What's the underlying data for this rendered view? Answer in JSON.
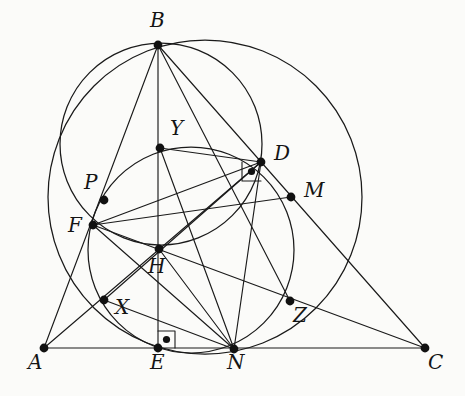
{
  "figure": {
    "kind": "euclidean-geometry-diagram",
    "width": 465,
    "height": 396,
    "background_color": "#fbfbf9",
    "ink_color": "#1a1a1a"
  },
  "points": [
    {
      "id": "A",
      "label": "A",
      "x": 44,
      "y": 348,
      "label_x": 28,
      "label_y": 352
    },
    {
      "id": "B",
      "label": "B",
      "x": 158,
      "y": 45,
      "label_x": 150,
      "label_y": 10
    },
    {
      "id": "C",
      "label": "C",
      "x": 425,
      "y": 348,
      "label_x": 428,
      "label_y": 352
    },
    {
      "id": "D",
      "label": "D",
      "x": 261,
      "y": 162,
      "label_x": 274,
      "label_y": 143
    },
    {
      "id": "E",
      "label": "E",
      "x": 158,
      "y": 348,
      "label_x": 150,
      "label_y": 352
    },
    {
      "id": "F",
      "label": "F",
      "x": 93,
      "y": 225,
      "label_x": 68,
      "label_y": 215
    },
    {
      "id": "H",
      "label": "H",
      "x": 159,
      "y": 249,
      "label_x": 148,
      "label_y": 256
    },
    {
      "id": "M",
      "label": "M",
      "x": 291,
      "y": 197,
      "label_x": 304,
      "label_y": 180
    },
    {
      "id": "N",
      "label": "N",
      "x": 234,
      "y": 349,
      "label_x": 227,
      "label_y": 352
    },
    {
      "id": "P",
      "label": "P",
      "x": 104,
      "y": 200,
      "label_x": 84,
      "label_y": 172
    },
    {
      "id": "X",
      "label": "X",
      "x": 104,
      "y": 300,
      "label_x": 115,
      "label_y": 297
    },
    {
      "id": "Y",
      "label": "Y",
      "x": 160,
      "y": 148,
      "label_x": 170,
      "label_y": 118
    },
    {
      "id": "Z",
      "label": "Z",
      "x": 290,
      "y": 301,
      "label_x": 293,
      "label_y": 305
    }
  ],
  "segments": [
    {
      "name": "side-AB",
      "from": "A",
      "to": "B"
    },
    {
      "name": "side-AC",
      "from": "A",
      "to": "C"
    },
    {
      "name": "side-BC",
      "from": "B",
      "to": "C"
    },
    {
      "name": "altitude-BE",
      "from": "B",
      "to": "E"
    },
    {
      "name": "cevian-BZ",
      "from": "B",
      "to": "Z"
    },
    {
      "name": "altitude-AD",
      "from": "A",
      "to": "D"
    },
    {
      "name": "segment-FC",
      "from": "F",
      "to": "C"
    },
    {
      "name": "segment-FN",
      "from": "F",
      "to": "N"
    },
    {
      "name": "segment-FD",
      "from": "F",
      "to": "D"
    },
    {
      "name": "segment-FM",
      "from": "F",
      "to": "M"
    },
    {
      "name": "segment-YD",
      "from": "Y",
      "to": "D"
    },
    {
      "name": "segment-YN",
      "from": "Y",
      "to": "N"
    },
    {
      "name": "segment-DN",
      "from": "D",
      "to": "N"
    },
    {
      "name": "segment-HN",
      "from": "H",
      "to": "N"
    },
    {
      "name": "segment-XN",
      "from": "X",
      "to": "N"
    },
    {
      "name": "segment-XD",
      "from": "X",
      "to": "D"
    }
  ],
  "circles": [
    {
      "name": "circumcircle-ABC",
      "cx": 161,
      "cy": 144,
      "r": 101
    },
    {
      "name": "nine-point-circle",
      "cx": 191,
      "cy": 250,
      "r": 103
    },
    {
      "name": "circle-BDNE",
      "cx": 205,
      "cy": 197,
      "r": 157
    }
  ],
  "right_angle_marks": [
    {
      "name": "right-angle-at-E",
      "vertex": "E",
      "size": 17,
      "dir_x": 1,
      "dir_y": -1,
      "dot": true
    },
    {
      "name": "right-angle-at-D",
      "vertex": "D",
      "size": 19,
      "dir_x": -1,
      "dir_y": 1,
      "dot": true
    }
  ]
}
